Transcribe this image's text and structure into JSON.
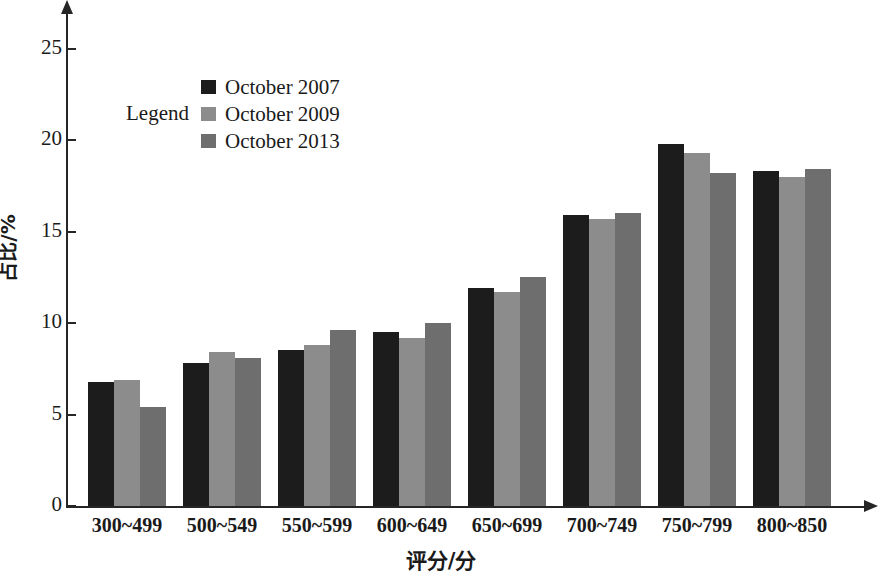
{
  "chart_data": {
    "type": "bar",
    "title": "",
    "xlabel": "评分/分",
    "ylabel": "占比/%",
    "ylim": [
      0,
      27
    ],
    "yticks": [
      0,
      5,
      10,
      15,
      20,
      25
    ],
    "ytick_labels": [
      "0",
      "5",
      "10",
      "15",
      "20",
      "25"
    ],
    "grid": false,
    "legend_title": "Legend",
    "legend_position": "upper-left-inside",
    "categories": [
      "300~499",
      "500~549",
      "550~599",
      "600~649",
      "650~699",
      "700~749",
      "750~799",
      "800~850"
    ],
    "series": [
      {
        "name": "October 2007",
        "color": "#1c1c1c",
        "values": [
          6.8,
          7.8,
          8.5,
          9.5,
          11.9,
          15.9,
          19.8,
          18.3
        ]
      },
      {
        "name": "October 2009",
        "color": "#8c8c8c",
        "values": [
          6.9,
          8.4,
          8.8,
          9.2,
          11.7,
          15.7,
          19.3,
          18.0
        ]
      },
      {
        "name": "October 2013",
        "color": "#6e6e6e",
        "values": [
          5.4,
          8.1,
          9.6,
          10.0,
          12.5,
          16.0,
          18.2,
          18.4
        ]
      }
    ]
  },
  "axis": {
    "y_axis_title": "占比/%",
    "x_axis_title": "评分/分"
  },
  "legend": {
    "title": "Legend",
    "items": [
      {
        "label": "October 2007",
        "color": "#1c1c1c"
      },
      {
        "label": "October 2009",
        "color": "#8c8c8c"
      },
      {
        "label": "October 2013",
        "color": "#6e6e6e"
      }
    ]
  }
}
